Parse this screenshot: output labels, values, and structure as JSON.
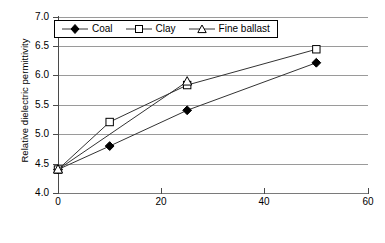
{
  "chart_data": {
    "type": "line",
    "title": "",
    "xlabel": "Relative ballast fouling ratio (%)",
    "ylabel": "Relative dielectric permittivity",
    "xlim": [
      0,
      60
    ],
    "ylim": [
      4.0,
      7.0
    ],
    "xticks": [
      "0",
      "20",
      "40",
      "60"
    ],
    "yticks": [
      "4.0",
      "4.5",
      "5.0",
      "5.5",
      "6.0",
      "6.5",
      "7.0"
    ],
    "grid": "horizontal",
    "legend_position": "top-left-inside",
    "series": [
      {
        "name": "Coal",
        "marker": "filled-diamond",
        "x": [
          0,
          10,
          25,
          50
        ],
        "values": [
          4.4,
          4.8,
          5.41,
          6.22
        ]
      },
      {
        "name": "Clay",
        "marker": "open-square",
        "x": [
          0,
          10,
          25,
          50
        ],
        "values": [
          4.4,
          5.21,
          5.84,
          6.45
        ]
      },
      {
        "name": "Fine ballast",
        "marker": "open-triangle",
        "x": [
          0,
          25
        ],
        "values": [
          4.4,
          5.9
        ]
      }
    ]
  },
  "axes": {
    "y_title": "Relative dielectric permittivity",
    "x_title": "Relative ballast fouling ratio (%)",
    "y_tick_labels": [
      "7.0",
      "6.5",
      "6.0",
      "5.5",
      "5.0",
      "4.5",
      "4.0"
    ],
    "x_tick_labels": [
      "0",
      "20",
      "40",
      "60"
    ]
  },
  "legend": {
    "items": [
      {
        "label": "Coal",
        "marker": "filled-diamond"
      },
      {
        "label": "Clay",
        "marker": "open-square"
      },
      {
        "label": "Fine ballast",
        "marker": "open-triangle"
      }
    ]
  },
  "colors": {
    "line": "#333333",
    "grid": "#9a9a9a",
    "axis": "#4a4a4a",
    "marker_fill_open": "#ffffff",
    "marker_fill_solid": "#000000",
    "background": "#ffffff"
  }
}
